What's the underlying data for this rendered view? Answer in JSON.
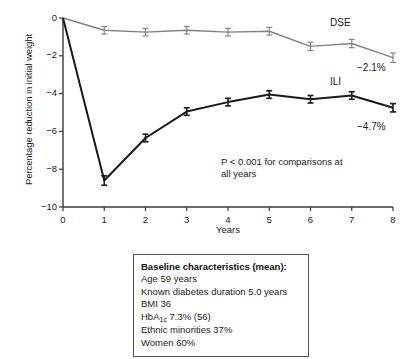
{
  "chart_data": {
    "type": "line",
    "title": "",
    "xlabel": "Years",
    "ylabel": "Percentage reduction in initial weight",
    "x": [
      0,
      1,
      2,
      3,
      4,
      5,
      6,
      7,
      8
    ],
    "xlim": [
      0,
      8
    ],
    "ylim": [
      -10,
      0
    ],
    "yticks": [
      "0",
      "-2",
      "-4",
      "-6",
      "-8",
      "-10"
    ],
    "xticks": [
      "0",
      "1",
      "2",
      "3",
      "4",
      "5",
      "6",
      "7",
      "8"
    ],
    "grid": false,
    "legend_position": "inline-right",
    "series": [
      {
        "name": "DSE",
        "color": "#808080",
        "values": [
          0.0,
          -0.65,
          -0.75,
          -0.65,
          -0.75,
          -0.7,
          -1.5,
          -1.35,
          -2.1
        ],
        "errors": [
          0.0,
          0.2,
          0.2,
          0.2,
          0.2,
          0.2,
          0.22,
          0.22,
          0.25
        ],
        "end_label": "−2.1%"
      },
      {
        "name": "ILI",
        "color": "#1a1a1a",
        "values": [
          0.0,
          -8.6,
          -6.35,
          -4.95,
          -4.45,
          -4.05,
          -4.3,
          -4.1,
          -4.75
        ],
        "errors": [
          0.0,
          0.25,
          0.2,
          0.2,
          0.2,
          0.2,
          0.2,
          0.2,
          0.22
        ],
        "end_label": "−4.7%"
      }
    ],
    "annotations": [
      "P < 0.001 for comparisons at",
      "all years"
    ]
  },
  "baseline": {
    "title": "Baseline characteristics (mean):",
    "lines": [
      "Age 59 years",
      "Known diabetes duration 5.0 years",
      "BMI 36",
      "Ethnic minorities 37%",
      "Women 60%"
    ],
    "hba1c_prefix": "HbA",
    "hba1c_sub": "1c",
    "hba1c_suffix": " 7.3% (56)"
  },
  "colors": {
    "ili": "#1a1a1a",
    "dse": "#808080",
    "axis": "#3a3a3a",
    "box_border": "#555555"
  }
}
